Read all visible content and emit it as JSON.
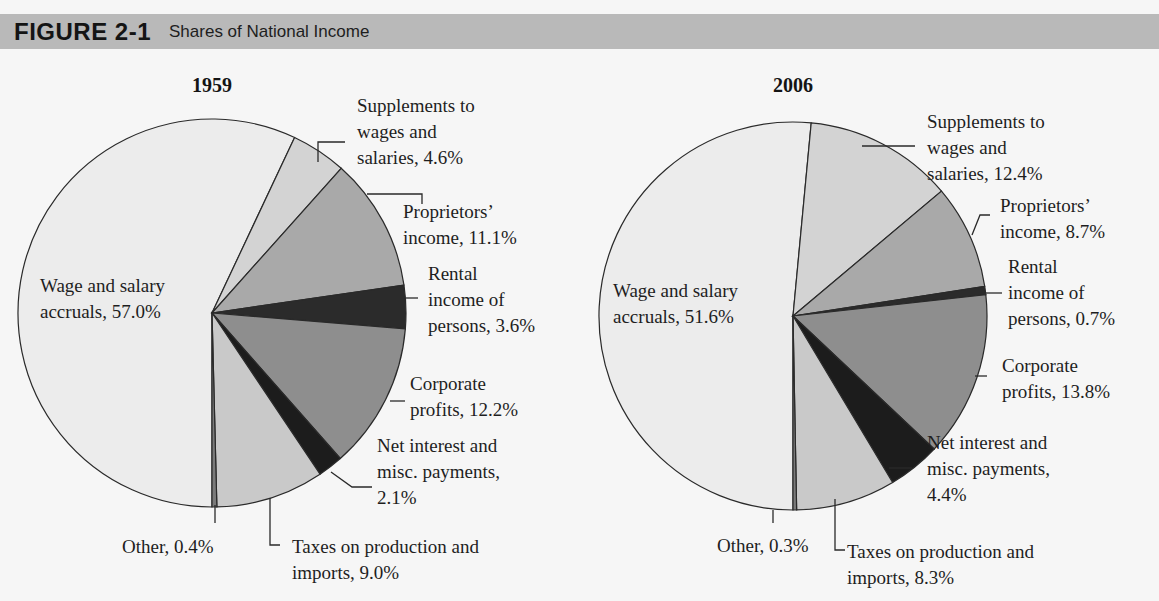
{
  "header": {
    "figure_number": "FIGURE 2-1",
    "figure_title": "Shares of National Income"
  },
  "colors": {
    "header_bg": "#b9b9b9",
    "wage": "#ececec",
    "supplements": "#d3d3d3",
    "proprietors": "#a9a9a9",
    "rental": "#2b2b2b",
    "corporate": "#8e8e8e",
    "net_interest": "#1c1c1c",
    "taxes": "#c9c9c9",
    "other": "#7a7a7a"
  },
  "chart_data": [
    {
      "type": "pie",
      "title": "1959",
      "figure_title": "Shares of National Income",
      "categories": [
        "Wage and salary accruals",
        "Supplements to wages and salaries",
        "Proprietors' income",
        "Rental income of persons",
        "Corporate profits",
        "Net interest and misc. payments",
        "Taxes on production and imports",
        "Other"
      ],
      "values": [
        57.0,
        4.6,
        11.1,
        3.6,
        12.2,
        2.1,
        9.0,
        0.4
      ],
      "unit": "%",
      "labels": [
        {
          "lines": [
            "Wage and salary",
            "accruals, 57.0%"
          ]
        },
        {
          "lines": [
            "Supplements to",
            "wages and",
            "salaries, 4.6%"
          ]
        },
        {
          "lines": [
            "Proprietors’",
            "income, 11.1%"
          ]
        },
        {
          "lines": [
            "Rental",
            "income of",
            "persons, 3.6%"
          ]
        },
        {
          "lines": [
            "Corporate",
            "profits, 12.2%"
          ]
        },
        {
          "lines": [
            "Net interest and",
            "misc. payments,",
            "2.1%"
          ]
        },
        {
          "lines": [
            "Taxes on production and",
            "imports, 9.0%"
          ]
        },
        {
          "lines": [
            "Other, 0.4%"
          ]
        }
      ]
    },
    {
      "type": "pie",
      "title": "2006",
      "figure_title": "Shares of National Income",
      "categories": [
        "Wage and salary accruals",
        "Supplements to wages and salaries",
        "Proprietors' income",
        "Rental income of persons",
        "Corporate profits",
        "Net interest and misc. payments",
        "Taxes on production and imports",
        "Other"
      ],
      "values": [
        51.6,
        12.4,
        8.7,
        0.7,
        13.8,
        4.4,
        8.3,
        0.3
      ],
      "unit": "%",
      "labels": [
        {
          "lines": [
            "Wage and salary",
            "accruals, 51.6%"
          ]
        },
        {
          "lines": [
            "Supplements to",
            "wages and",
            "salaries, 12.4%"
          ]
        },
        {
          "lines": [
            "Proprietors’",
            "income, 8.7%"
          ]
        },
        {
          "lines": [
            "Rental",
            "income of",
            "persons, 0.7%"
          ]
        },
        {
          "lines": [
            "Corporate",
            "profits, 13.8%"
          ]
        },
        {
          "lines": [
            "Net interest and",
            "misc. payments,",
            "4.4%"
          ]
        },
        {
          "lines": [
            "Taxes on production and",
            "imports, 8.3%"
          ]
        },
        {
          "lines": [
            "Other, 0.3%"
          ]
        }
      ]
    }
  ]
}
